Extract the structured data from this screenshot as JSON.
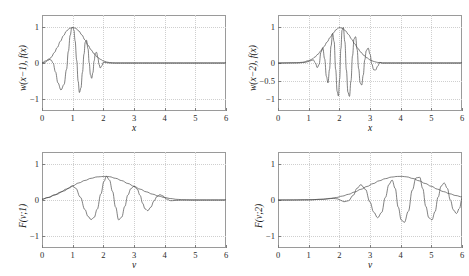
{
  "figure": {
    "background": "#ffffff",
    "curve_color": "#4a4a4a",
    "axis_color": "#9a9a9a",
    "grid_color": "#cfcfcf"
  },
  "chart_data": [
    {
      "id": "top-left",
      "type": "line",
      "title": "",
      "xlabel": "x",
      "ylabel": "w(x−1), f(x)",
      "xlim": [
        0,
        6
      ],
      "ylim": [
        -1.35,
        1.35
      ],
      "xticks": [
        0,
        1,
        2,
        3,
        4,
        5,
        6
      ],
      "xticklabels": [
        "0",
        "1",
        "2",
        "3",
        "4",
        "5",
        "6"
      ],
      "yticks": [
        -1,
        0,
        1
      ],
      "yticklabels": [
        "−1",
        "0",
        "1"
      ],
      "grid": true,
      "legend": false,
      "series": [
        {
          "name": "envelope w(x-1)",
          "comment": "Gaussian-like window centred at x=1, peak 1.0, decaying to 0 by x=2.4",
          "x": [
            0.0,
            0.1,
            0.2,
            0.3,
            0.4,
            0.5,
            0.6,
            0.7,
            0.8,
            0.9,
            1.0,
            1.1,
            1.2,
            1.3,
            1.4,
            1.5,
            1.6,
            1.7,
            1.8,
            1.9,
            2.0,
            2.1,
            2.2,
            2.3,
            2.4,
            3.0,
            4.0,
            5.0,
            6.0
          ],
          "y": [
            0.0,
            0.02,
            0.075,
            0.16,
            0.29,
            0.44,
            0.61,
            0.77,
            0.9,
            0.975,
            1.0,
            0.975,
            0.9,
            0.79,
            0.65,
            0.5,
            0.37,
            0.26,
            0.17,
            0.105,
            0.06,
            0.03,
            0.013,
            0.004,
            0.0,
            0.0,
            0.0,
            0.0,
            0.0
          ]
        },
        {
          "name": "f(x) chirp under envelope",
          "comment": "oscillation of increasing frequency modulated by the window; extrema reach +1 at x=1 and about -0.85 near x=1.2",
          "x": [
            0.0,
            0.12,
            0.22,
            0.3,
            0.36,
            0.44,
            0.52,
            0.62,
            0.72,
            0.8,
            0.86,
            0.92,
            0.97,
            1.0,
            1.04,
            1.08,
            1.13,
            1.18,
            1.22,
            1.27,
            1.32,
            1.37,
            1.41,
            1.45,
            1.5,
            1.54,
            1.58,
            1.62,
            1.66,
            1.7,
            1.74,
            1.78,
            1.82,
            1.86,
            1.9,
            1.95,
            2.0,
            2.1,
            2.2,
            2.4,
            3.0,
            4.0,
            5.0,
            6.0
          ],
          "y": [
            0.0,
            0.06,
            0.11,
            0.08,
            0.0,
            -0.25,
            -0.56,
            -0.76,
            -0.6,
            -0.18,
            0.33,
            0.78,
            0.98,
            1.0,
            0.93,
            0.62,
            0.08,
            -0.52,
            -0.83,
            -0.7,
            -0.26,
            0.25,
            0.58,
            0.64,
            0.4,
            0.0,
            -0.33,
            -0.43,
            -0.27,
            0.06,
            0.28,
            0.3,
            0.16,
            -0.04,
            -0.14,
            -0.08,
            0.02,
            0.01,
            0.0,
            0.0,
            0.0,
            0.0,
            0.0,
            0.0
          ]
        }
      ]
    },
    {
      "id": "top-right",
      "type": "line",
      "title": "",
      "xlabel": "x",
      "ylabel": "w(x−2), f(x)",
      "xlim": [
        0,
        6
      ],
      "ylim": [
        -1.35,
        1.35
      ],
      "xticks": [
        0,
        1,
        2,
        3,
        4,
        5,
        6
      ],
      "xticklabels": [
        "0",
        "1",
        "2",
        "3",
        "4",
        "5",
        "6"
      ],
      "yticks": [
        -1,
        -0.5,
        0,
        1
      ],
      "yticklabels": [
        "−1",
        "−0.5",
        "0",
        "1"
      ],
      "grid": true,
      "legend": false,
      "series": [
        {
          "name": "envelope w(x-2)",
          "comment": "Gaussian window centred at x=2, peak 1.0, support roughly 0.7 to 3.4",
          "x": [
            0.0,
            0.6,
            0.8,
            1.0,
            1.1,
            1.2,
            1.3,
            1.4,
            1.5,
            1.6,
            1.7,
            1.8,
            1.9,
            2.0,
            2.1,
            2.2,
            2.3,
            2.4,
            2.5,
            2.6,
            2.7,
            2.8,
            2.9,
            3.0,
            3.1,
            3.2,
            3.3,
            3.4,
            4.0,
            5.0,
            6.0
          ],
          "y": [
            0.0,
            0.005,
            0.02,
            0.065,
            0.105,
            0.165,
            0.245,
            0.345,
            0.46,
            0.59,
            0.72,
            0.84,
            0.94,
            1.0,
            0.975,
            0.905,
            0.8,
            0.67,
            0.54,
            0.415,
            0.305,
            0.215,
            0.145,
            0.09,
            0.05,
            0.025,
            0.01,
            0.0,
            0.0,
            0.0,
            0.0
          ]
        },
        {
          "name": "f(x) chirp under envelope",
          "comment": "fast oscillation centred at x=2 with extrema near +1 and -0.97",
          "x": [
            0.0,
            0.7,
            0.9,
            1.05,
            1.15,
            1.22,
            1.28,
            1.34,
            1.4,
            1.46,
            1.52,
            1.58,
            1.63,
            1.68,
            1.73,
            1.78,
            1.83,
            1.88,
            1.93,
            1.97,
            2.01,
            2.05,
            2.09,
            2.13,
            2.18,
            2.23,
            2.28,
            2.33,
            2.38,
            2.43,
            2.48,
            2.53,
            2.58,
            2.63,
            2.68,
            2.73,
            2.78,
            2.83,
            2.88,
            2.94,
            3.0,
            3.06,
            3.12,
            3.18,
            3.25,
            3.32,
            3.4,
            4.0,
            5.0,
            6.0
          ],
          "y": [
            0.0,
            0.005,
            0.02,
            0.06,
            0.09,
            0.0,
            -0.13,
            -0.04,
            0.3,
            0.43,
            0.12,
            -0.38,
            -0.56,
            -0.18,
            0.48,
            0.83,
            0.6,
            -0.18,
            -0.8,
            -0.93,
            -0.45,
            0.4,
            0.93,
            1.0,
            0.6,
            -0.2,
            -0.82,
            -0.94,
            -0.5,
            0.2,
            0.68,
            0.74,
            0.38,
            -0.16,
            -0.56,
            -0.62,
            -0.34,
            0.09,
            0.35,
            0.42,
            0.25,
            -0.03,
            -0.19,
            -0.2,
            -0.09,
            0.02,
            0.0,
            0.0,
            0.0,
            0.0
          ]
        }
      ]
    },
    {
      "id": "bottom-left",
      "type": "line",
      "title": "",
      "xlabel": "ν",
      "ylabel": "F(ν;1)",
      "xlim": [
        0,
        6
      ],
      "ylim": [
        -1.35,
        1.35
      ],
      "xticks": [
        0,
        1,
        2,
        3,
        4,
        5,
        6
      ],
      "xticklabels": [
        "0",
        "1",
        "2",
        "3",
        "4",
        "5",
        "6"
      ],
      "yticks": [
        -1,
        0,
        1
      ],
      "yticklabels": [
        "−1",
        "0",
        "1"
      ],
      "grid": true,
      "legend": false,
      "series": [
        {
          "name": "envelope |F(v;1)|",
          "comment": "broad hump peaking about 0.66 near v=2.1, decaying to 0 by v=4.6",
          "x": [
            0.0,
            0.2,
            0.4,
            0.6,
            0.8,
            1.0,
            1.2,
            1.4,
            1.6,
            1.8,
            2.0,
            2.1,
            2.2,
            2.4,
            2.6,
            2.8,
            3.0,
            3.2,
            3.4,
            3.6,
            3.8,
            4.0,
            4.2,
            4.4,
            4.6,
            5.0,
            5.5,
            6.0
          ],
          "y": [
            0.02,
            0.07,
            0.14,
            0.22,
            0.31,
            0.4,
            0.48,
            0.55,
            0.61,
            0.65,
            0.66,
            0.665,
            0.655,
            0.61,
            0.545,
            0.465,
            0.385,
            0.305,
            0.23,
            0.165,
            0.11,
            0.07,
            0.04,
            0.018,
            0.005,
            0.0,
            0.0,
            0.0
          ]
        },
        {
          "name": "F(v;1) oscillatory part",
          "comment": "oscillation touching the envelope at its peaks; minima about -0.55 at v=1.6 and -0.58 at v=2.5",
          "x": [
            0.0,
            0.2,
            0.45,
            0.7,
            0.9,
            1.0,
            1.1,
            1.25,
            1.4,
            1.5,
            1.6,
            1.7,
            1.8,
            1.92,
            2.02,
            2.1,
            2.2,
            2.3,
            2.4,
            2.5,
            2.6,
            2.7,
            2.8,
            2.9,
            3.0,
            3.1,
            3.2,
            3.28,
            3.36,
            3.45,
            3.55,
            3.65,
            3.75,
            3.85,
            3.95,
            4.05,
            4.2,
            4.4,
            4.6,
            5.0,
            5.5,
            6.0
          ],
          "y": [
            0.02,
            0.07,
            0.15,
            0.25,
            0.34,
            0.39,
            0.33,
            0.08,
            -0.27,
            -0.46,
            -0.55,
            -0.49,
            -0.26,
            0.17,
            0.52,
            0.665,
            0.56,
            0.24,
            -0.2,
            -0.56,
            -0.48,
            -0.18,
            0.14,
            0.32,
            0.385,
            0.31,
            0.13,
            -0.09,
            -0.25,
            -0.3,
            -0.2,
            -0.03,
            0.1,
            0.15,
            0.11,
            0.03,
            -0.02,
            -0.01,
            0.0,
            0.0,
            0.0,
            0.0
          ]
        }
      ]
    },
    {
      "id": "bottom-right",
      "type": "line",
      "title": "",
      "xlabel": "ν",
      "ylabel": "F(ν;2)",
      "xlim": [
        0,
        6
      ],
      "ylim": [
        -1.35,
        1.35
      ],
      "xticks": [
        0,
        1,
        2,
        3,
        4,
        5,
        6
      ],
      "xticklabels": [
        "0",
        "1",
        "2",
        "3",
        "4",
        "5",
        "6"
      ],
      "yticks": [
        -1,
        0,
        1
      ],
      "yticklabels": [
        "−1",
        "0",
        "1"
      ],
      "grid": true,
      "legend": false,
      "series": [
        {
          "name": "envelope |F(v;2)|",
          "comment": "hump peaking about 0.66 near v=4.1, still positive at v=6",
          "x": [
            0.0,
            0.5,
            1.0,
            1.4,
            1.7,
            1.9,
            2.1,
            2.3,
            2.5,
            2.7,
            2.9,
            3.1,
            3.3,
            3.5,
            3.7,
            3.9,
            4.05,
            4.2,
            4.4,
            4.6,
            4.8,
            5.0,
            5.2,
            5.4,
            5.6,
            5.8,
            6.0
          ],
          "y": [
            0.0,
            0.0,
            0.005,
            0.02,
            0.045,
            0.07,
            0.11,
            0.16,
            0.225,
            0.3,
            0.38,
            0.46,
            0.54,
            0.6,
            0.645,
            0.663,
            0.665,
            0.65,
            0.605,
            0.54,
            0.465,
            0.385,
            0.305,
            0.235,
            0.175,
            0.125,
            0.085
          ]
        },
        {
          "name": "F(v;2) oscillatory part",
          "comment": "oscillation with minima near -0.63 at v=3.8 and -0.60 at v=4.4",
          "x": [
            0.0,
            1.0,
            1.5,
            1.8,
            1.95,
            2.05,
            2.15,
            2.3,
            2.45,
            2.58,
            2.7,
            2.85,
            3.0,
            3.12,
            3.25,
            3.38,
            3.5,
            3.62,
            3.72,
            3.82,
            3.92,
            4.02,
            4.12,
            4.25,
            4.38,
            4.5,
            4.62,
            4.72,
            4.82,
            4.92,
            5.02,
            5.12,
            5.22,
            5.32,
            5.42,
            5.52,
            5.62,
            5.72,
            5.82,
            5.92,
            6.0
          ],
          "y": [
            0.0,
            0.005,
            0.02,
            0.045,
            0.03,
            -0.01,
            -0.05,
            -0.02,
            0.13,
            0.33,
            0.43,
            0.3,
            -0.06,
            -0.34,
            -0.5,
            -0.35,
            0.07,
            0.44,
            0.56,
            0.33,
            -0.2,
            -0.56,
            -0.63,
            -0.32,
            0.28,
            0.62,
            0.64,
            0.32,
            -0.18,
            -0.5,
            -0.56,
            -0.33,
            0.08,
            0.39,
            0.48,
            0.33,
            0.0,
            -0.28,
            -0.38,
            -0.23,
            0.06
          ]
        }
      ]
    }
  ]
}
